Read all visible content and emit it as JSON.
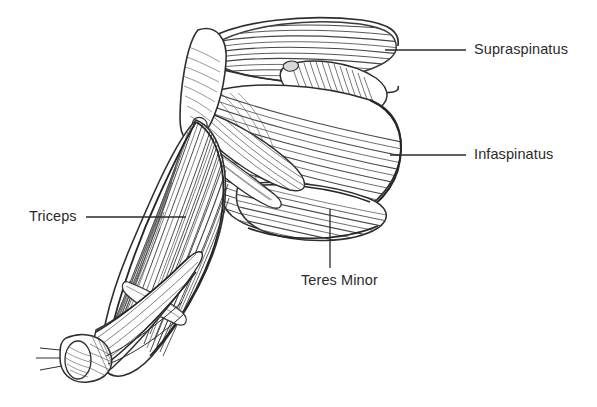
{
  "figure": {
    "background_color": "#ffffff",
    "ink_color": "#3a3a3a",
    "label_color": "#2b2b2b",
    "width": 597,
    "height": 407
  },
  "labels": [
    {
      "id": "supraspinatus",
      "text": "Supraspinatus",
      "leader": {
        "type": "horizontal",
        "x1": 385,
        "y1": 50,
        "x2": 466,
        "y2": 50
      }
    },
    {
      "id": "infaspinatus",
      "text": "Infaspinatus",
      "leader": {
        "type": "horizontal",
        "x1": 390,
        "y1": 155,
        "x2": 466,
        "y2": 155
      }
    },
    {
      "id": "triceps",
      "text": "Triceps",
      "leader": {
        "type": "horizontal",
        "x1": 86,
        "y1": 217,
        "x2": 186,
        "y2": 217
      }
    },
    {
      "id": "teres-minor",
      "text": "Teres Minor",
      "leader": {
        "type": "vertical",
        "x1": 330,
        "y1": 209,
        "x2": 330,
        "y2": 268
      }
    }
  ],
  "structures": [
    {
      "name": "supraspinatus-muscle"
    },
    {
      "name": "infraspinatus-muscle"
    },
    {
      "name": "teres-minor-muscle"
    },
    {
      "name": "triceps-muscle"
    },
    {
      "name": "scapula-spine"
    },
    {
      "name": "acromion-deltoid-region"
    },
    {
      "name": "humerus-cut-end"
    },
    {
      "name": "forearm-outline"
    }
  ]
}
